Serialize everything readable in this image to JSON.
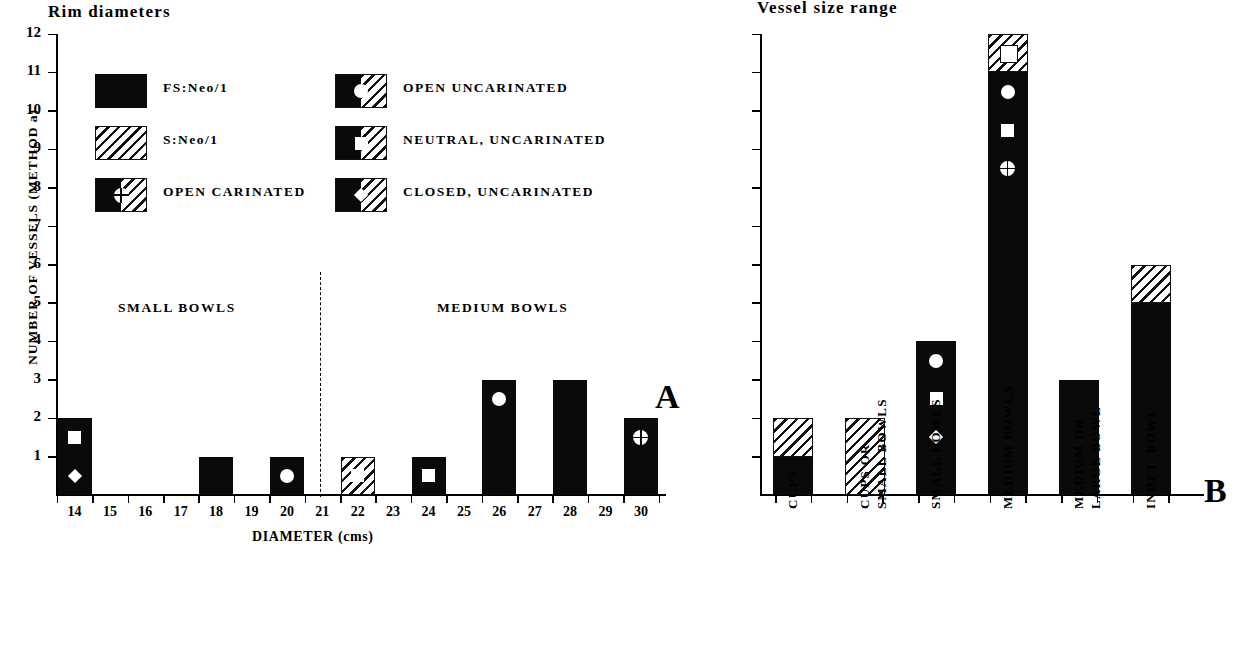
{
  "figure": {
    "panel_a": {
      "title": "Rim diameters",
      "letter": "A",
      "ylabel": "NUMBER OF VESSELS (METHOD a)",
      "xlabel": "DIAMETER (cms)",
      "group_labels": [
        "SMALL BOWLS",
        "MEDIUM BOWLS"
      ],
      "ytick_labels": [
        "1",
        "2",
        "3",
        "4",
        "5",
        "6",
        "7",
        "8",
        "9",
        "10",
        "11",
        "12"
      ],
      "xtick_labels": [
        "14",
        "15",
        "16",
        "17",
        "18",
        "19",
        "20",
        "21",
        "22",
        "23",
        "24",
        "25",
        "26",
        "27",
        "28",
        "29",
        "30"
      ]
    },
    "panel_b": {
      "title": "Vessel size range",
      "letter": "B",
      "category_labels": [
        "CUPS",
        "CUPS OR\nSMALL BOWLS",
        "SMALL BOWLS",
        "MEDIUM BOWLS",
        "MEDIUM OR\nLARGE BOWL",
        "INDET. BOWL"
      ]
    },
    "legend": {
      "items": [
        {
          "label": "FS:Neo/1",
          "swatch": "solid-black"
        },
        {
          "label": "S:Neo/1",
          "swatch": "hatched"
        },
        {
          "label": "OPEN CARINATED",
          "swatch": "split-crossed-circle"
        },
        {
          "label": "OPEN UNCARINATED",
          "swatch": "split-circle"
        },
        {
          "label": "NEUTRAL, UNCARINATED",
          "swatch": "split-square"
        },
        {
          "label": "CLOSED, UNCARINATED",
          "swatch": "split-diamond"
        }
      ]
    }
  },
  "chart_data": [
    {
      "type": "bar",
      "id": "panel-a",
      "title": "Rim diameters",
      "xlabel": "DIAMETER (cms)",
      "ylabel": "NUMBER OF VESSELS (METHOD a)",
      "ylim": [
        0,
        12
      ],
      "grid": false,
      "legend_position": "top-inside",
      "categories": [
        "14",
        "15",
        "16",
        "17",
        "18",
        "19",
        "20",
        "21",
        "22",
        "23",
        "24",
        "25",
        "26",
        "27",
        "28",
        "29",
        "30"
      ],
      "series": [
        {
          "name": "FS:Neo/1",
          "fill": "solid-black",
          "values": [
            2,
            0,
            0,
            0,
            1,
            0,
            1,
            0,
            0,
            0,
            1,
            0,
            3,
            0,
            3,
            0,
            2
          ]
        },
        {
          "name": "S:Neo/1",
          "fill": "hatched",
          "values": [
            0,
            0,
            0,
            0,
            0,
            0,
            0,
            0,
            1,
            0,
            0,
            0,
            0,
            0,
            0,
            0,
            0
          ]
        }
      ],
      "annotations": [
        {
          "category": "14",
          "marker": "neutral-uncarinated",
          "value": 1.5
        },
        {
          "category": "14",
          "marker": "closed-uncarinated",
          "value": 0.5
        },
        {
          "category": "20",
          "marker": "open-uncarinated",
          "value": 0.5
        },
        {
          "category": "22",
          "marker": "neutral-uncarinated",
          "value": 0.5
        },
        {
          "category": "24",
          "marker": "neutral-uncarinated",
          "value": 0.5
        },
        {
          "category": "26",
          "marker": "open-uncarinated",
          "value": 2.5
        },
        {
          "category": "30",
          "marker": "open-carinated",
          "value": 1.5
        }
      ],
      "group_dividers": [
        {
          "after_category": "20",
          "label_left": "SMALL BOWLS",
          "label_right": "MEDIUM BOWLS"
        }
      ]
    },
    {
      "type": "bar",
      "id": "panel-b",
      "title": "Vessel size range",
      "xlabel": "",
      "ylabel": "",
      "ylim": [
        0,
        12
      ],
      "grid": false,
      "stacked": true,
      "categories": [
        "CUPS",
        "CUPS OR SMALL BOWLS",
        "SMALL BOWLS",
        "MEDIUM BOWLS",
        "MEDIUM OR LARGE BOWL",
        "INDET. BOWL"
      ],
      "series": [
        {
          "name": "FS:Neo/1",
          "fill": "solid-black",
          "values": [
            1,
            0,
            4,
            11,
            3,
            5
          ]
        },
        {
          "name": "S:Neo/1",
          "fill": "hatched",
          "values": [
            1,
            2,
            0,
            1,
            0,
            1
          ]
        }
      ],
      "totals": [
        2,
        2,
        4,
        12,
        3,
        6
      ],
      "annotations": [
        {
          "category": "SMALL BOWLS",
          "marker": "open-uncarinated",
          "value": 3.5
        },
        {
          "category": "SMALL BOWLS",
          "marker": "neutral-uncarinated",
          "value": 2.5
        },
        {
          "category": "SMALL BOWLS",
          "marker": "closed-uncarinated",
          "value": 1.5
        },
        {
          "category": "MEDIUM BOWLS",
          "marker": "neutral-uncarinated-open",
          "value": 11.5
        },
        {
          "category": "MEDIUM BOWLS",
          "marker": "open-uncarinated",
          "value": 10.5
        },
        {
          "category": "MEDIUM BOWLS",
          "marker": "neutral-uncarinated",
          "value": 9.5
        },
        {
          "category": "MEDIUM BOWLS",
          "marker": "open-carinated",
          "value": 8.5
        }
      ]
    }
  ]
}
